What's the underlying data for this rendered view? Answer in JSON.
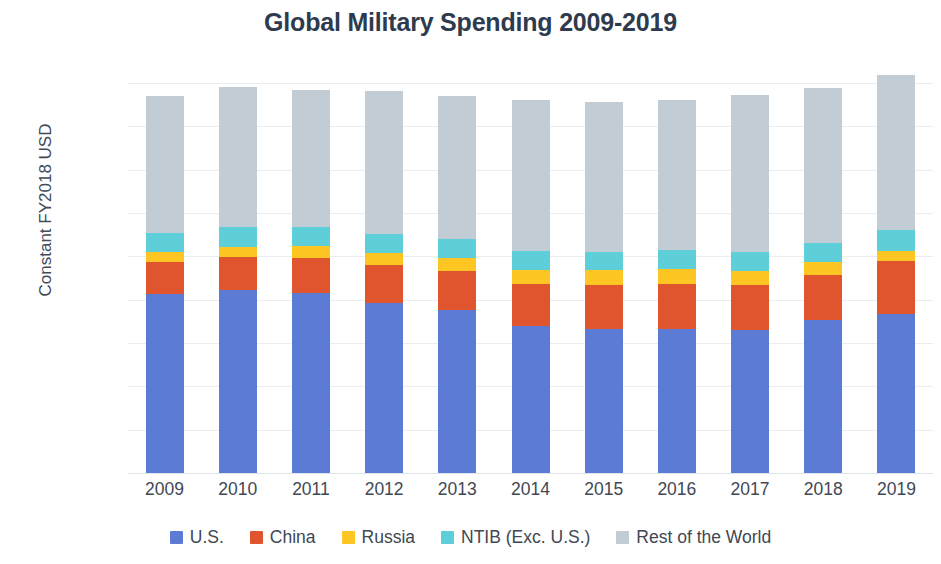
{
  "chart_data": {
    "type": "bar",
    "stacked": true,
    "title": "Global Military Spending 2009-2019",
    "xlabel": "",
    "ylabel": "Constant FY2018 USD",
    "categories": [
      "2009",
      "2010",
      "2011",
      "2012",
      "2013",
      "2014",
      "2015",
      "2016",
      "2017",
      "2018",
      "2019"
    ],
    "ylim": [
      0,
      1800
    ],
    "ytick_values": [
      0,
      200,
      400,
      600,
      800,
      1000,
      1200,
      1400,
      1600,
      1800
    ],
    "ytick_labels": [
      "$0B",
      "$200B",
      "$400B",
      "$600B",
      "$800B",
      "$1000B",
      "$1200B",
      "$1400B",
      "$1600B",
      "$1800B"
    ],
    "grid": true,
    "legend_position": "bottom",
    "series": [
      {
        "name": "U.S.",
        "color": "#5b7bd5",
        "values": [
          826,
          845,
          832,
          786,
          751,
          680,
          665,
          665,
          658,
          705,
          735
        ]
      },
      {
        "name": "China",
        "color": "#e0542e",
        "values": [
          148,
          152,
          162,
          172,
          182,
          192,
          202,
          208,
          212,
          208,
          243
        ]
      },
      {
        "name": "Russia",
        "color": "#fdc623",
        "values": [
          45,
          48,
          52,
          58,
          61,
          66,
          68,
          70,
          62,
          61,
          46
        ]
      },
      {
        "name": "NTIB (Exc. U.S.)",
        "color": "#5ecfd8",
        "values": [
          91,
          92,
          90,
          89,
          88,
          88,
          86,
          86,
          88,
          88,
          98
        ]
      },
      {
        "name": "Rest of the World",
        "color": "#c2ccd4",
        "values": [
          631,
          644,
          632,
          656,
          656,
          696,
          692,
          692,
          726,
          715,
          715
        ]
      }
    ],
    "totals": [
      1741,
      1781,
      1768,
      1761,
      1738,
      1722,
      1713,
      1721,
      1746,
      1777,
      1837
    ]
  },
  "axis": {
    "y_title": "Constant FY2018 USD"
  }
}
